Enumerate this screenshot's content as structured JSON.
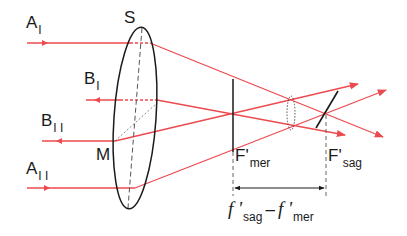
{
  "diagram": {
    "colors": {
      "ray": "#ec4a4f",
      "line": "#1a1a1a",
      "dashed": "#555555"
    },
    "labels": {
      "A_I": {
        "main": "A",
        "sub": "I"
      },
      "B_I": {
        "main": "B",
        "sub": "I"
      },
      "B_II": {
        "main": "B",
        "sub": "I I"
      },
      "A_II": {
        "main": "A",
        "sub": "I I"
      },
      "S": "S",
      "M": "M",
      "F_mer": {
        "main": "F'",
        "sub": "mer"
      },
      "F_sag": {
        "main": "F'",
        "sub": "sag"
      },
      "difference": {
        "f1": "f '",
        "sub1": "sag",
        "minus": "–",
        "f2": "f '",
        "sub2": "mer"
      }
    }
  }
}
